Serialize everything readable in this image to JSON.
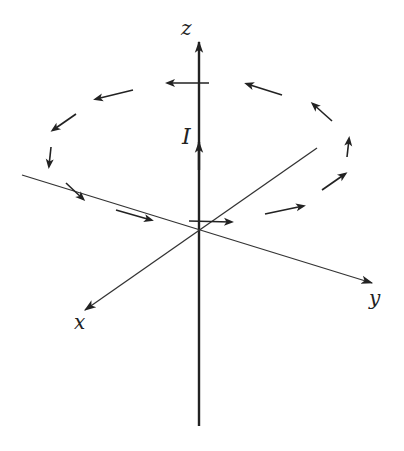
{
  "figure": {
    "colors": {
      "ink": "#222222",
      "background": "#ffffff"
    },
    "labels": {
      "z_axis": "z",
      "x_axis": "x",
      "y_axis": "y",
      "current": "I"
    },
    "axes": {
      "origin": [
        199,
        230
      ],
      "z": {
        "from": [
          199,
          426
        ],
        "to": [
          199,
          40
        ]
      },
      "x": {
        "from": [
          317,
          148
        ],
        "to": [
          85,
          310
        ]
      },
      "y": {
        "from": [
          22,
          175
        ],
        "to": [
          372,
          283
        ]
      }
    },
    "current_arrow": {
      "at": [
        199,
        150
      ],
      "direction": "up"
    },
    "field_arrows": [
      {
        "from": [
          209,
          83
        ],
        "to": [
          168,
          83
        ]
      },
      {
        "from": [
          133,
          90
        ],
        "to": [
          96,
          99
        ]
      },
      {
        "from": [
          76,
          114
        ],
        "to": [
          53,
          130
        ]
      },
      {
        "from": [
          51,
          147
        ],
        "to": [
          49,
          166
        ]
      },
      {
        "from": [
          66,
          183
        ],
        "to": [
          83,
          199
        ]
      },
      {
        "from": [
          116,
          210
        ],
        "to": [
          151,
          220
        ]
      },
      {
        "from": [
          189,
          221
        ],
        "to": [
          231,
          222
        ]
      },
      {
        "from": [
          265,
          214
        ],
        "to": [
          303,
          206
        ]
      },
      {
        "from": [
          322,
          190
        ],
        "to": [
          345,
          174
        ]
      },
      {
        "from": [
          347,
          157
        ],
        "to": [
          349,
          139
        ]
      },
      {
        "from": [
          332,
          121
        ],
        "to": [
          313,
          104
        ]
      },
      {
        "from": [
          282,
          95
        ],
        "to": [
          247,
          84
        ]
      }
    ]
  }
}
